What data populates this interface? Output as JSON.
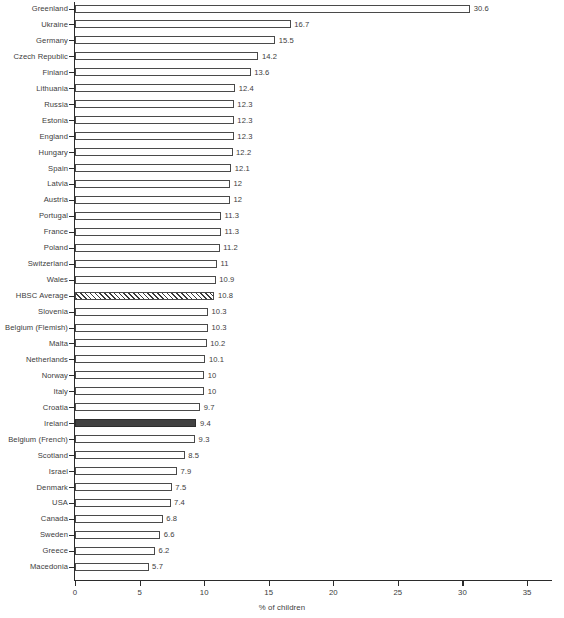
{
  "chart_data": {
    "type": "bar",
    "orientation": "horizontal",
    "title": "",
    "xlabel": "% of children",
    "ylabel": "",
    "xlim": [
      0,
      35
    ],
    "xticks": [
      0,
      5,
      10,
      15,
      20,
      25,
      30,
      35
    ],
    "grid": false,
    "legend": null,
    "categories": [
      "Greenland",
      "Ukraine",
      "Germany",
      "Czech Republic",
      "Finland",
      "Lithuania",
      "Russia",
      "Estonia",
      "England",
      "Hungary",
      "Spain",
      "Latvia",
      "Austria",
      "Portugal",
      "France",
      "Poland",
      "Switzerland",
      "Wales",
      "HBSC Average",
      "Slovenia",
      "Belgium (Flemish)",
      "Malta",
      "Netherlands",
      "Norway",
      "Italy",
      "Croatia",
      "Ireland",
      "Belgium (French)",
      "Scotland",
      "Israel",
      "Denmark",
      "USA",
      "Canada",
      "Sweden",
      "Greece",
      "Macedonia"
    ],
    "values": [
      30.6,
      16.7,
      15.5,
      14.2,
      13.6,
      12.4,
      12.3,
      12.3,
      12.3,
      12.2,
      12.1,
      12,
      12,
      11.3,
      11.3,
      11.2,
      11,
      10.9,
      10.8,
      10.3,
      10.3,
      10.2,
      10.1,
      10,
      10,
      9.7,
      9.4,
      9.3,
      8.5,
      7.9,
      7.5,
      7.4,
      6.8,
      6.6,
      6.2,
      5.7
    ],
    "value_labels": [
      "30.6",
      "16.7",
      "15.5",
      "14.2",
      "13.6",
      "12.4",
      "12.3",
      "12.3",
      "12.3",
      "12.2",
      "12.1",
      "12",
      "12",
      "11.3",
      "11.3",
      "11.2",
      "11",
      "10.9",
      "10.8",
      "10.3",
      "10.3",
      "10.2",
      "10.1",
      "10",
      "10",
      "9.7",
      "9.4",
      "9.3",
      "8.5",
      "7.9",
      "7.5",
      "7.4",
      "6.8",
      "6.6",
      "6.2",
      "5.7"
    ],
    "bar_styles": [
      "outline",
      "outline",
      "outline",
      "outline",
      "outline",
      "outline",
      "outline",
      "outline",
      "outline",
      "outline",
      "outline",
      "outline",
      "outline",
      "outline",
      "outline",
      "outline",
      "outline",
      "outline",
      "hatched",
      "outline",
      "outline",
      "outline",
      "outline",
      "outline",
      "outline",
      "outline",
      "solid",
      "outline",
      "outline",
      "outline",
      "outline",
      "outline",
      "outline",
      "outline",
      "outline",
      "outline"
    ],
    "colors": {
      "bar_outline": "#4a4a4a",
      "bar_fill": "#ffffff",
      "highlight_fill": "#424242",
      "hatch_line": "#3a3a3a",
      "axis": "#2b2b2b",
      "text": "#3c3c3c",
      "background": "#ffffff"
    },
    "highlighted_category": "Ireland",
    "average_category": "HBSC Average"
  }
}
